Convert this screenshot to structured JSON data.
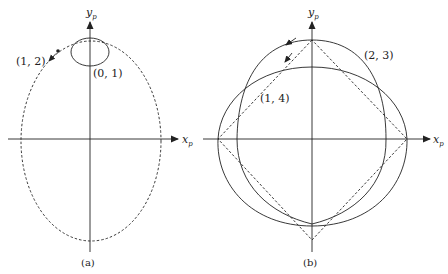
{
  "panels": [
    {
      "id": "a",
      "caption": "(a)",
      "axes": {
        "x_label": "x",
        "x_sub": "p",
        "y_label": "y",
        "y_sub": "p"
      },
      "annotations": [
        {
          "text": "(1, 2)",
          "target": "dashed large ellipse"
        },
        {
          "text": "(0, 1)",
          "target": "small solid ellipse"
        }
      ]
    },
    {
      "id": "b",
      "caption": "(b)",
      "axes": {
        "x_label": "x",
        "x_sub": "p",
        "y_label": "y",
        "y_sub": "p"
      },
      "annotations": [
        {
          "text": "(2, 3)",
          "target": "outer solid curve"
        },
        {
          "text": "(1, 4)",
          "target": "inner solid curve"
        }
      ]
    }
  ],
  "colors": {
    "stroke": "#222222",
    "background": "#ffffff"
  }
}
